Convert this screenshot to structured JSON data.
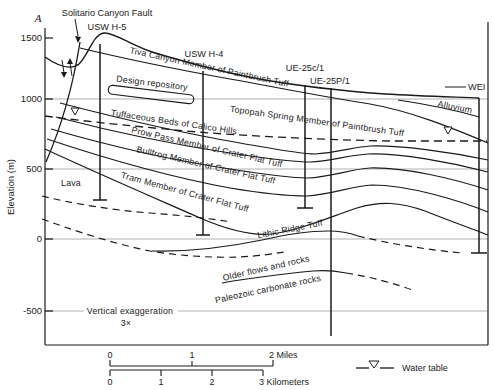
{
  "section": {
    "marker": "A"
  },
  "axis": {
    "label": "Elevation (m)",
    "ticks": [
      "1500",
      "1000",
      "500",
      "0",
      "-500"
    ]
  },
  "labels": {
    "fault": "Solitario Canyon Fault",
    "well_h5": "USW H-5",
    "well_h4": "USW H-4",
    "well_c1": "UE-25c/1",
    "well_p1": "UE-25P/1",
    "well_right": "WEI",
    "alluvium": "Alluvium",
    "tiva": "Tiva Canyon Member of Paintbrush Tuff",
    "design_repository": "Design repository",
    "topopah": "Topopah Spring Member of Paintbrush Tuff",
    "calico": "Tuffaceous Beds of Calico Hills",
    "prow": "Prow Pass Member of Crater Flat Tuff",
    "bullfrog": "Bullfrog Member of Crater Flat Tuff",
    "tram": "Tram Member of Crater Flat Tuff",
    "lava": "Lava",
    "lithic": "Lithic Ridge Tuff",
    "older": "Older flows and rocks",
    "paleozoic": "Paleozoic carbonate rocks",
    "vert_exag_1": "Vertical exaggeration",
    "vert_exag_2": "3×"
  },
  "scalebar": {
    "miles": [
      "0",
      "1",
      "2 Miles"
    ],
    "kilometers": [
      "0",
      "1",
      "2",
      "3 Kilometers"
    ]
  },
  "legend": {
    "water_table": "Water table"
  },
  "colors": {
    "line": "#1a1a1a",
    "grid": "#b0b0b0",
    "background": "#ffffff"
  }
}
